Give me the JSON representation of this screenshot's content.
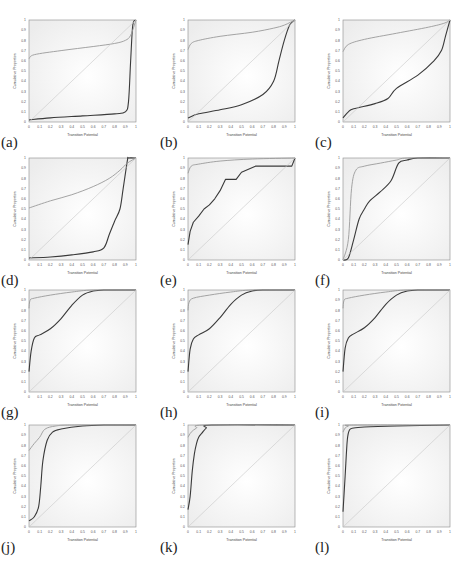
{
  "figure": {
    "panel_labels": [
      "(a)",
      "(b)",
      "(c)",
      "(d)",
      "(e)",
      "(f)",
      "(g)",
      "(h)",
      "(i)",
      "(j)",
      "(k)",
      "(l)"
    ],
    "xlabel": "Transition Potential",
    "ylabel": "Cumulative Proportion",
    "xticks": [
      "0",
      "0.1",
      "0.2",
      "0.3",
      "0.4",
      "0.5",
      "0.6",
      "0.7",
      "0.8",
      "0.9",
      "1"
    ],
    "yticks": [
      "0",
      "0.1",
      "0.2",
      "0.3",
      "0.4",
      "0.5",
      "0.6",
      "0.7",
      "0.8",
      "0.9",
      "1"
    ],
    "colors": {
      "plot_bg": "#ececec",
      "dark_curve": "#3a3a3a",
      "light_curve": "#9a9a9a",
      "diagonal": "#c8c8c8",
      "frame": "#8a8a8a"
    }
  },
  "chart_data": [
    {
      "panel": "(a)",
      "type": "line",
      "xlabel": "Transition Potential",
      "ylabel": "Cumulative Proportion",
      "xlim": [
        0,
        1
      ],
      "ylim": [
        0,
        1
      ],
      "series": [
        {
          "name": "dark",
          "x": [
            0,
            0.2,
            0.5,
            0.8,
            0.9,
            0.93,
            0.95,
            0.97,
            1
          ],
          "y": [
            0.02,
            0.04,
            0.06,
            0.08,
            0.1,
            0.2,
            0.6,
            0.95,
            1
          ]
        },
        {
          "name": "light",
          "x": [
            0,
            0.05,
            0.3,
            0.6,
            0.8,
            0.9,
            0.95,
            1
          ],
          "y": [
            0.62,
            0.66,
            0.7,
            0.74,
            0.77,
            0.8,
            0.85,
            1
          ]
        },
        {
          "name": "diagonal",
          "x": [
            0,
            1
          ],
          "y": [
            0,
            1
          ]
        }
      ]
    },
    {
      "panel": "(b)",
      "type": "line",
      "xlabel": "Transition Potential",
      "ylabel": "Cumulative Proportion",
      "xlim": [
        0,
        1
      ],
      "ylim": [
        0,
        1
      ],
      "series": [
        {
          "name": "dark",
          "x": [
            0,
            0.1,
            0.3,
            0.5,
            0.7,
            0.8,
            0.85,
            0.9,
            0.95,
            1
          ],
          "y": [
            0.04,
            0.08,
            0.12,
            0.17,
            0.27,
            0.4,
            0.6,
            0.8,
            0.95,
            1
          ]
        },
        {
          "name": "light",
          "x": [
            0,
            0.03,
            0.1,
            0.3,
            0.6,
            0.8,
            0.9,
            1
          ],
          "y": [
            0.71,
            0.77,
            0.8,
            0.84,
            0.88,
            0.92,
            0.95,
            1
          ]
        },
        {
          "name": "diagonal",
          "x": [
            0,
            1
          ],
          "y": [
            0,
            1
          ]
        }
      ]
    },
    {
      "panel": "(c)",
      "type": "line",
      "xlabel": "Transition Potential",
      "ylabel": "Cumulative Proportion",
      "xlim": [
        0,
        1
      ],
      "ylim": [
        0,
        1
      ],
      "series": [
        {
          "name": "dark",
          "x": [
            0,
            0.05,
            0.1,
            0.3,
            0.42,
            0.5,
            0.7,
            0.85,
            0.92,
            0.96,
            1
          ],
          "y": [
            0.04,
            0.1,
            0.13,
            0.18,
            0.23,
            0.33,
            0.46,
            0.6,
            0.7,
            0.85,
            1
          ]
        },
        {
          "name": "light",
          "x": [
            0,
            0.05,
            0.2,
            0.5,
            0.8,
            0.95,
            1
          ],
          "y": [
            0.69,
            0.76,
            0.81,
            0.87,
            0.93,
            0.97,
            1
          ]
        },
        {
          "name": "diagonal",
          "x": [
            0,
            1
          ],
          "y": [
            0,
            1
          ]
        }
      ]
    },
    {
      "panel": "(d)",
      "type": "line",
      "xlabel": "Transition Potential",
      "ylabel": "Cumulative Proportion",
      "xlim": [
        0,
        1
      ],
      "ylim": [
        0,
        1
      ],
      "series": [
        {
          "name": "dark",
          "x": [
            0,
            0.2,
            0.4,
            0.6,
            0.7,
            0.75,
            0.8,
            0.85,
            0.88,
            0.92,
            0.93,
            1
          ],
          "y": [
            0.02,
            0.03,
            0.05,
            0.08,
            0.12,
            0.25,
            0.38,
            0.5,
            0.7,
            0.98,
            1,
            1
          ]
        },
        {
          "name": "light",
          "x": [
            0,
            0.2,
            0.4,
            0.6,
            0.75,
            0.85,
            0.92,
            1
          ],
          "y": [
            0.51,
            0.58,
            0.64,
            0.72,
            0.8,
            0.88,
            0.95,
            1
          ]
        },
        {
          "name": "diagonal",
          "x": [
            0,
            1
          ],
          "y": [
            0,
            1
          ]
        }
      ]
    },
    {
      "panel": "(e)",
      "type": "line",
      "xlabel": "Transition Potential",
      "ylabel": "Cumulative Proportion",
      "xlim": [
        0,
        1
      ],
      "ylim": [
        0,
        1
      ],
      "series": [
        {
          "name": "dark",
          "x": [
            0,
            0.02,
            0.05,
            0.1,
            0.15,
            0.2,
            0.25,
            0.3,
            0.35,
            0.45,
            0.5,
            0.63,
            0.97,
            1
          ],
          "y": [
            0.15,
            0.28,
            0.37,
            0.43,
            0.5,
            0.54,
            0.6,
            0.68,
            0.79,
            0.79,
            0.86,
            0.92,
            0.92,
            1
          ]
        },
        {
          "name": "light",
          "x": [
            0,
            0.03,
            0.1,
            0.3,
            0.6,
            1
          ],
          "y": [
            0.85,
            0.92,
            0.94,
            0.97,
            0.99,
            1
          ]
        },
        {
          "name": "diagonal",
          "x": [
            0,
            1
          ],
          "y": [
            0,
            1
          ]
        }
      ]
    },
    {
      "panel": "(f)",
      "type": "line",
      "xlabel": "Transition Potential",
      "ylabel": "Cumulative Proportion",
      "xlim": [
        0,
        1
      ],
      "ylim": [
        0,
        1
      ],
      "series": [
        {
          "name": "dark",
          "x": [
            0,
            0.05,
            0.1,
            0.15,
            0.2,
            0.25,
            0.35,
            0.45,
            0.52,
            0.6,
            0.7,
            1
          ],
          "y": [
            0,
            0.02,
            0.2,
            0.4,
            0.5,
            0.58,
            0.67,
            0.78,
            0.95,
            0.98,
            1,
            1
          ]
        },
        {
          "name": "light",
          "x": [
            0,
            0.05,
            0.08,
            0.12,
            0.2,
            0.35,
            0.5,
            0.6,
            1
          ],
          "y": [
            0,
            0.2,
            0.7,
            0.88,
            0.92,
            0.95,
            0.98,
            1,
            1
          ]
        },
        {
          "name": "diagonal",
          "x": [
            0,
            1
          ],
          "y": [
            0,
            1
          ]
        }
      ]
    },
    {
      "panel": "(g)",
      "type": "line",
      "xlabel": "Transition Potential",
      "ylabel": "Cumulative Proportion",
      "xlim": [
        0,
        1
      ],
      "ylim": [
        0,
        1
      ],
      "series": [
        {
          "name": "dark",
          "x": [
            0,
            0.02,
            0.05,
            0.1,
            0.2,
            0.3,
            0.4,
            0.5,
            0.6,
            0.7,
            1
          ],
          "y": [
            0.2,
            0.4,
            0.53,
            0.56,
            0.62,
            0.72,
            0.85,
            0.95,
            0.99,
            1,
            1
          ]
        },
        {
          "name": "light",
          "x": [
            0,
            0.01,
            0.05,
            0.2,
            0.4,
            0.6,
            1
          ],
          "y": [
            0.82,
            0.9,
            0.92,
            0.95,
            0.98,
            1,
            1
          ]
        },
        {
          "name": "diagonal",
          "x": [
            0,
            1
          ],
          "y": [
            0,
            1
          ]
        }
      ]
    },
    {
      "panel": "(h)",
      "type": "line",
      "xlabel": "Transition Potential",
      "ylabel": "Cumulative Proportion",
      "xlim": [
        0,
        1
      ],
      "ylim": [
        0,
        1
      ],
      "series": [
        {
          "name": "dark",
          "x": [
            0,
            0.02,
            0.05,
            0.1,
            0.2,
            0.3,
            0.4,
            0.5,
            0.6,
            0.7,
            1
          ],
          "y": [
            0.2,
            0.42,
            0.52,
            0.56,
            0.62,
            0.73,
            0.86,
            0.95,
            0.99,
            1,
            1
          ]
        },
        {
          "name": "light",
          "x": [
            0,
            0.01,
            0.05,
            0.2,
            0.4,
            0.6,
            1
          ],
          "y": [
            0.8,
            0.88,
            0.92,
            0.95,
            0.98,
            1,
            1
          ]
        },
        {
          "name": "diagonal",
          "x": [
            0,
            1
          ],
          "y": [
            0,
            1
          ]
        }
      ]
    },
    {
      "panel": "(i)",
      "type": "line",
      "xlabel": "Transition Potential",
      "ylabel": "Cumulative Proportion",
      "xlim": [
        0,
        1
      ],
      "ylim": [
        0,
        1
      ],
      "series": [
        {
          "name": "dark",
          "x": [
            0,
            0.02,
            0.05,
            0.1,
            0.2,
            0.3,
            0.4,
            0.5,
            0.6,
            0.7,
            1
          ],
          "y": [
            0.2,
            0.43,
            0.53,
            0.57,
            0.63,
            0.73,
            0.86,
            0.95,
            0.99,
            1,
            1
          ]
        },
        {
          "name": "light",
          "x": [
            0,
            0.01,
            0.05,
            0.2,
            0.4,
            0.6,
            1
          ],
          "y": [
            0.82,
            0.9,
            0.92,
            0.95,
            0.98,
            1,
            1
          ]
        },
        {
          "name": "diagonal",
          "x": [
            0,
            1
          ],
          "y": [
            0,
            1
          ]
        }
      ]
    },
    {
      "panel": "(j)",
      "type": "line",
      "xlabel": "Transition Potential",
      "ylabel": "Cumulative Proportion",
      "xlim": [
        0,
        1
      ],
      "ylim": [
        0,
        1
      ],
      "series": [
        {
          "name": "dark",
          "x": [
            0,
            0.05,
            0.09,
            0.11,
            0.13,
            0.17,
            0.22,
            0.3,
            0.5,
            0.7,
            1
          ],
          "y": [
            0.06,
            0.1,
            0.2,
            0.4,
            0.65,
            0.85,
            0.93,
            0.96,
            0.99,
            1,
            1
          ]
        },
        {
          "name": "light",
          "x": [
            0,
            0.05,
            0.1,
            0.15,
            0.25,
            0.4,
            1
          ],
          "y": [
            0.75,
            0.82,
            0.88,
            0.96,
            0.99,
            1,
            1
          ]
        },
        {
          "name": "diagonal",
          "x": [
            0,
            1
          ],
          "y": [
            0,
            1
          ]
        }
      ]
    },
    {
      "panel": "(k)",
      "type": "line",
      "xlabel": "Transition Potential",
      "ylabel": "Cumulative Proportion",
      "xlim": [
        0,
        1
      ],
      "ylim": [
        0,
        1
      ],
      "series": [
        {
          "name": "dark",
          "x": [
            0,
            0.02,
            0.04,
            0.06,
            0.08,
            0.1,
            0.13,
            0.17,
            0.22,
            1
          ],
          "y": [
            0.17,
            0.3,
            0.55,
            0.72,
            0.82,
            0.88,
            0.92,
            0.97,
            1,
            1
          ]
        },
        {
          "name": "light",
          "x": [
            0,
            0.03,
            0.08,
            0.15,
            1
          ],
          "y": [
            0.88,
            0.93,
            0.97,
            1,
            1
          ]
        },
        {
          "name": "diagonal",
          "x": [
            0,
            1
          ],
          "y": [
            0,
            1
          ]
        }
      ]
    },
    {
      "panel": "(l)",
      "type": "line",
      "xlabel": "Transition Potential",
      "ylabel": "Cumulative Proportion",
      "xlim": [
        0,
        1
      ],
      "ylim": [
        0,
        1
      ],
      "series": [
        {
          "name": "dark",
          "x": [
            0,
            0.02,
            0.04,
            0.06,
            0.1,
            0.2,
            0.5,
            1
          ],
          "y": [
            0.15,
            0.5,
            0.85,
            0.95,
            0.97,
            0.98,
            0.99,
            1
          ]
        },
        {
          "name": "light",
          "x": [
            0,
            0.02,
            0.05,
            0.1,
            1
          ],
          "y": [
            0.93,
            0.97,
            0.99,
            1,
            1
          ]
        },
        {
          "name": "diagonal",
          "x": [
            0,
            1
          ],
          "y": [
            0,
            1
          ]
        }
      ]
    }
  ]
}
